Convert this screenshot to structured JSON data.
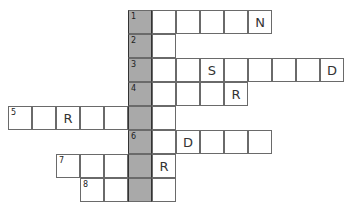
{
  "puzzle": {
    "cell_size": 24,
    "origin_x": 8,
    "origin_y": 10,
    "highlight_column": 5,
    "highlight_color": "#a9a9a9",
    "rows": [
      {
        "clue": "1",
        "start_col": 5,
        "length": 6,
        "letters": {
          "10": "N"
        }
      },
      {
        "clue": "2",
        "start_col": 5,
        "length": 2,
        "letters": {}
      },
      {
        "clue": "3",
        "start_col": 5,
        "length": 9,
        "letters": {
          "8": "S",
          "13": "D"
        }
      },
      {
        "clue": "4",
        "start_col": 5,
        "length": 5,
        "letters": {
          "9": "R"
        }
      },
      {
        "clue": "5",
        "start_col": 0,
        "length": 7,
        "letters": {
          "2": "R"
        }
      },
      {
        "clue": "6",
        "start_col": 5,
        "length": 6,
        "letters": {
          "7": "D"
        }
      },
      {
        "clue": "7",
        "start_col": 2,
        "length": 5,
        "letters": {
          "6": "R"
        }
      },
      {
        "clue": "8",
        "start_col": 3,
        "length": 4,
        "letters": {}
      }
    ]
  }
}
